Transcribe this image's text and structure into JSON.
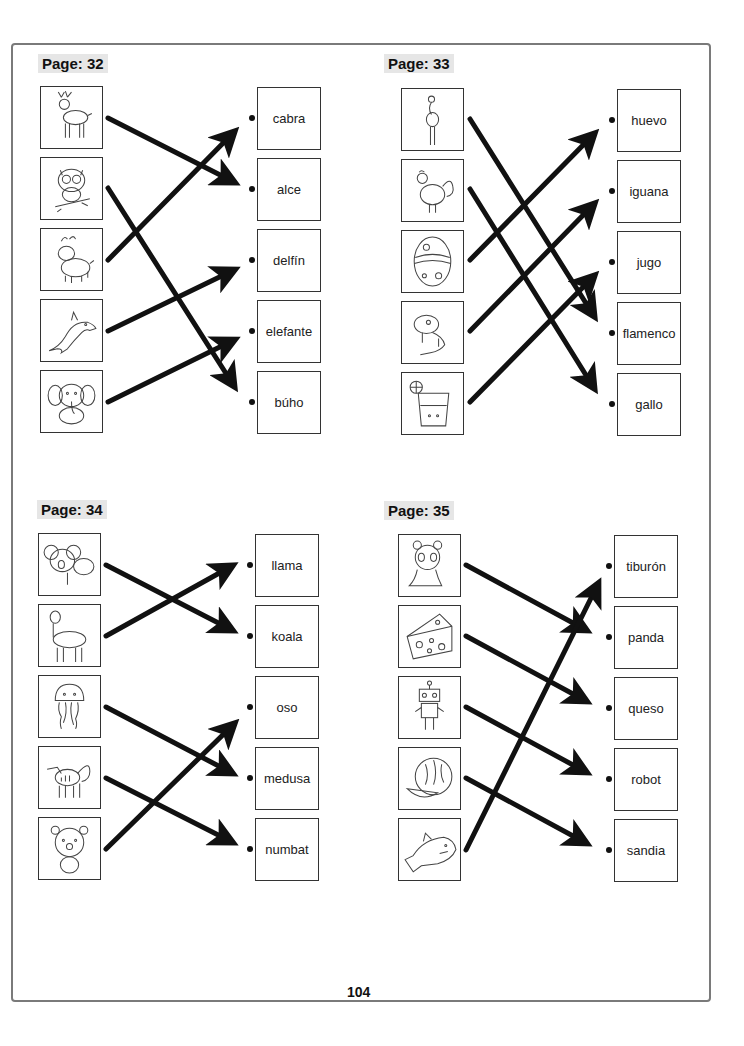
{
  "page_number": "104",
  "accent_colors": {
    "frame": "#7a7a7a",
    "label_bg": "#e6e6e6",
    "arrow": "#111111"
  },
  "sections": [
    {
      "label": "Page: 32",
      "pictures": [
        "deer-icon",
        "owl-icon",
        "goat-icon",
        "dolphin-icon",
        "elephant-icon"
      ],
      "words": [
        "cabra",
        "alce",
        "delfín",
        "elefante",
        "búho"
      ],
      "matches": [
        {
          "from": "deer",
          "to": "alce"
        },
        {
          "from": "owl",
          "to": "búho"
        },
        {
          "from": "goat",
          "to": "cabra"
        },
        {
          "from": "dolphin",
          "to": "delfín"
        },
        {
          "from": "elephant",
          "to": "elefante"
        }
      ]
    },
    {
      "label": "Page: 33",
      "pictures": [
        "flamingo-icon",
        "rooster-icon",
        "egg-icon",
        "iguana-icon",
        "juice-icon"
      ],
      "words": [
        "huevo",
        "iguana",
        "jugo",
        "flamenco",
        "gallo"
      ],
      "matches": [
        {
          "from": "flamingo",
          "to": "flamenco"
        },
        {
          "from": "rooster",
          "to": "gallo"
        },
        {
          "from": "egg",
          "to": "huevo"
        },
        {
          "from": "iguana",
          "to": "iguana"
        },
        {
          "from": "juice",
          "to": "jugo"
        }
      ]
    },
    {
      "label": "Page: 34",
      "pictures": [
        "koala-icon",
        "llama-icon",
        "jellyfish-icon",
        "numbat-icon",
        "bear-icon"
      ],
      "words": [
        "llama",
        "koala",
        "oso",
        "medusa",
        "numbat"
      ],
      "matches": [
        {
          "from": "koala",
          "to": "koala"
        },
        {
          "from": "llama",
          "to": "llama"
        },
        {
          "from": "jellyfish",
          "to": "medusa"
        },
        {
          "from": "numbat",
          "to": "numbat"
        },
        {
          "from": "bear",
          "to": "oso"
        }
      ]
    },
    {
      "label": "Page: 35",
      "pictures": [
        "panda-icon",
        "cheese-icon",
        "robot-icon",
        "watermelon-icon",
        "shark-icon"
      ],
      "words": [
        "tiburón",
        "panda",
        "queso",
        "robot",
        "sandia"
      ],
      "matches": [
        {
          "from": "panda",
          "to": "panda"
        },
        {
          "from": "cheese",
          "to": "queso"
        },
        {
          "from": "robot",
          "to": "robot"
        },
        {
          "from": "watermelon",
          "to": "sandia"
        },
        {
          "from": "shark",
          "to": "tiburón"
        }
      ]
    }
  ]
}
